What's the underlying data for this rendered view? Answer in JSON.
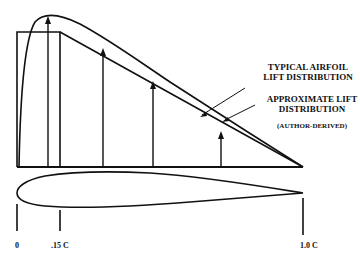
{
  "diagram": {
    "legend": {
      "typical": [
        "TYPICAL AIRFOIL",
        "LIFT DISTRIBUTION"
      ],
      "approximate": [
        "APPROXIMATE LIFT",
        "DISTRIBUTION"
      ],
      "note": "(AUTHOR-DERIVED)"
    },
    "axis_labels": {
      "start": "0",
      "quarter": ".15 C",
      "end": "1.0 C"
    },
    "colors": {
      "ink": "#111111",
      "background": "#ffffff"
    }
  }
}
